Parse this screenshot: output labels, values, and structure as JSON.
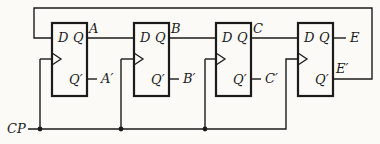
{
  "diagram": {
    "type": "logic-circuit",
    "clock_label": "CP",
    "flipflops": [
      {
        "d": "D",
        "q": "Q",
        "qp": "Q′",
        "q_out": "A",
        "qp_out": "A′"
      },
      {
        "d": "D",
        "q": "Q",
        "qp": "Q′",
        "q_out": "B",
        "qp_out": "B′"
      },
      {
        "d": "D",
        "q": "Q",
        "qp": "Q′",
        "q_out": "C",
        "qp_out": "C′"
      },
      {
        "d": "D",
        "q": "Q",
        "qp": "Q′",
        "q_out": "E",
        "qp_out": "E′"
      }
    ],
    "colors": {
      "line": "#1b1b1b",
      "background": "#fbfaf7"
    }
  }
}
